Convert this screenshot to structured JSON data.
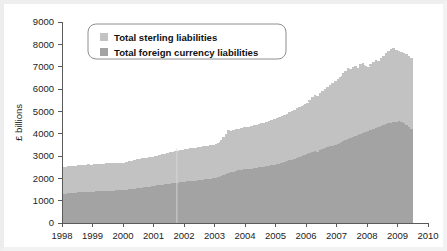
{
  "chart_data": {
    "type": "area",
    "title": "",
    "xlabel": "",
    "ylabel": "£ billions",
    "xlim": [
      1998.0,
      2010.0
    ],
    "ylim": [
      0,
      9000
    ],
    "grid": false,
    "stacked": true,
    "legend_position": "top-left",
    "x_tick_labels": [
      "1998",
      "1999",
      "2000",
      "2001",
      "2002",
      "2003",
      "2004",
      "2005",
      "2006",
      "2007",
      "2008",
      "2009",
      "2010"
    ],
    "x_ticks": [
      1998,
      1999,
      2000,
      2001,
      2002,
      2003,
      2004,
      2005,
      2006,
      2007,
      2008,
      2009,
      2010
    ],
    "y_tick_labels": [
      "0",
      "1000",
      "2000",
      "3000",
      "4000",
      "5000",
      "6000",
      "7000",
      "8000",
      "9000"
    ],
    "y_ticks": [
      0,
      1000,
      2000,
      3000,
      4000,
      5000,
      6000,
      7000,
      8000,
      9000
    ],
    "data_end_x": 2009.5,
    "colors": {
      "total_sterling_liabilities": "#c2c2c2",
      "total_foreign_currency_liabilities": "#a3a3a3",
      "axis": "#5a5a5a",
      "text": "#1c1c1c",
      "background": "#ffffff"
    },
    "series": [
      {
        "name": "Total foreign currency liabilities",
        "color": "#a3a3a3",
        "x": [
          1998.0,
          1998.08,
          1998.17,
          1998.25,
          1998.33,
          1998.42,
          1998.5,
          1998.58,
          1998.67,
          1998.75,
          1998.83,
          1998.92,
          1999.0,
          1999.08,
          1999.17,
          1999.25,
          1999.33,
          1999.42,
          1999.5,
          1999.58,
          1999.67,
          1999.75,
          1999.83,
          1999.92,
          2000.0,
          2000.08,
          2000.17,
          2000.25,
          2000.33,
          2000.42,
          2000.5,
          2000.58,
          2000.67,
          2000.75,
          2000.83,
          2000.92,
          2001.0,
          2001.08,
          2001.17,
          2001.25,
          2001.33,
          2001.42,
          2001.5,
          2001.58,
          2001.67,
          2001.75,
          2001.83,
          2001.92,
          2002.0,
          2002.08,
          2002.17,
          2002.25,
          2002.33,
          2002.42,
          2002.5,
          2002.58,
          2002.67,
          2002.75,
          2002.83,
          2002.92,
          2003.0,
          2003.08,
          2003.17,
          2003.25,
          2003.33,
          2003.42,
          2003.5,
          2003.58,
          2003.67,
          2003.75,
          2003.83,
          2003.92,
          2004.0,
          2004.08,
          2004.17,
          2004.25,
          2004.33,
          2004.42,
          2004.5,
          2004.58,
          2004.67,
          2004.75,
          2004.83,
          2004.92,
          2005.0,
          2005.08,
          2005.17,
          2005.25,
          2005.33,
          2005.42,
          2005.5,
          2005.58,
          2005.67,
          2005.75,
          2005.83,
          2005.92,
          2006.0,
          2006.08,
          2006.17,
          2006.25,
          2006.33,
          2006.42,
          2006.5,
          2006.58,
          2006.67,
          2006.75,
          2006.83,
          2006.92,
          2007.0,
          2007.08,
          2007.17,
          2007.25,
          2007.33,
          2007.42,
          2007.5,
          2007.58,
          2007.67,
          2007.75,
          2007.83,
          2007.92,
          2008.0,
          2008.08,
          2008.17,
          2008.25,
          2008.33,
          2008.42,
          2008.5,
          2008.58,
          2008.67,
          2008.75,
          2008.83,
          2008.92,
          2009.0,
          2009.08,
          2009.17,
          2009.25,
          2009.33,
          2009.42,
          2009.5
        ],
        "values": [
          1300,
          1320,
          1335,
          1340,
          1355,
          1360,
          1370,
          1380,
          1375,
          1390,
          1400,
          1395,
          1405,
          1415,
          1420,
          1430,
          1425,
          1440,
          1450,
          1445,
          1455,
          1460,
          1470,
          1465,
          1480,
          1500,
          1520,
          1530,
          1545,
          1560,
          1570,
          1580,
          1595,
          1610,
          1625,
          1640,
          1660,
          1680,
          1700,
          1710,
          1725,
          1740,
          1755,
          1770,
          1785,
          1800,
          1815,
          1830,
          1845,
          1860,
          1875,
          1885,
          1900,
          1915,
          1930,
          1945,
          1960,
          1975,
          1990,
          2005,
          2020,
          2060,
          2100,
          2150,
          2190,
          2230,
          2270,
          2300,
          2330,
          2360,
          2380,
          2400,
          2410,
          2420,
          2430,
          2450,
          2470,
          2490,
          2510,
          2530,
          2550,
          2570,
          2590,
          2610,
          2630,
          2660,
          2690,
          2720,
          2760,
          2800,
          2840,
          2880,
          2920,
          2960,
          3000,
          3040,
          3080,
          3130,
          3180,
          3230,
          3200,
          3250,
          3300,
          3350,
          3400,
          3430,
          3460,
          3500,
          3550,
          3600,
          3650,
          3700,
          3760,
          3800,
          3850,
          3900,
          3950,
          4000,
          4050,
          4080,
          4100,
          4150,
          4200,
          4250,
          4280,
          4330,
          4380,
          4430,
          4460,
          4490,
          4520,
          4540,
          4560,
          4530,
          4480,
          4400,
          4300,
          4200,
          4050
        ]
      },
      {
        "name": "Total sterling liabilities",
        "color": "#c2c2c2",
        "x": [
          1998.0,
          1998.08,
          1998.17,
          1998.25,
          1998.33,
          1998.42,
          1998.5,
          1998.58,
          1998.67,
          1998.75,
          1998.83,
          1998.92,
          1999.0,
          1999.08,
          1999.17,
          1999.25,
          1999.33,
          1999.42,
          1999.5,
          1999.58,
          1999.67,
          1999.75,
          1999.83,
          1999.92,
          2000.0,
          2000.08,
          2000.17,
          2000.25,
          2000.33,
          2000.42,
          2000.5,
          2000.58,
          2000.67,
          2000.75,
          2000.83,
          2000.92,
          2001.0,
          2001.08,
          2001.17,
          2001.25,
          2001.33,
          2001.42,
          2001.5,
          2001.58,
          2001.67,
          2001.75,
          2001.83,
          2001.92,
          2002.0,
          2002.08,
          2002.17,
          2002.25,
          2002.33,
          2002.42,
          2002.5,
          2002.58,
          2002.67,
          2002.75,
          2002.83,
          2002.92,
          2003.0,
          2003.08,
          2003.17,
          2003.25,
          2003.33,
          2003.42,
          2003.5,
          2003.58,
          2003.67,
          2003.75,
          2003.83,
          2003.92,
          2004.0,
          2004.08,
          2004.17,
          2004.25,
          2004.33,
          2004.42,
          2004.5,
          2004.58,
          2004.67,
          2004.75,
          2004.83,
          2004.92,
          2005.0,
          2005.08,
          2005.17,
          2005.25,
          2005.33,
          2005.42,
          2005.5,
          2005.58,
          2005.67,
          2005.75,
          2005.83,
          2005.92,
          2006.0,
          2006.08,
          2006.17,
          2006.25,
          2006.33,
          2006.42,
          2006.5,
          2006.58,
          2006.67,
          2006.75,
          2006.83,
          2006.92,
          2007.0,
          2007.08,
          2007.17,
          2007.25,
          2007.33,
          2007.42,
          2007.5,
          2007.58,
          2007.67,
          2007.75,
          2007.83,
          2007.92,
          2008.0,
          2008.08,
          2008.17,
          2008.25,
          2008.33,
          2008.42,
          2008.5,
          2008.58,
          2008.67,
          2008.75,
          2008.83,
          2008.92,
          2009.0,
          2009.08,
          2009.17,
          2009.25,
          2009.33,
          2009.42,
          2009.5
        ],
        "values_total": [
          2500,
          2520,
          2540,
          2550,
          2560,
          2570,
          2580,
          2600,
          2590,
          2610,
          2620,
          2615,
          2620,
          2630,
          2640,
          2655,
          2650,
          2665,
          2675,
          2670,
          2680,
          2690,
          2700,
          2695,
          2700,
          2720,
          2760,
          2790,
          2820,
          2850,
          2870,
          2890,
          2910,
          2930,
          2950,
          2970,
          2990,
          3020,
          3060,
          3080,
          3110,
          3140,
          3170,
          3190,
          3220,
          3240,
          3260,
          3290,
          3310,
          3330,
          3350,
          3360,
          3380,
          3400,
          3420,
          3440,
          3460,
          3470,
          3490,
          3510,
          3530,
          3600,
          3700,
          3850,
          4000,
          4150,
          4120,
          4180,
          4200,
          4230,
          4260,
          4280,
          4300,
          4320,
          4340,
          4370,
          4400,
          4430,
          4460,
          4490,
          4520,
          4560,
          4600,
          4640,
          4680,
          4730,
          4780,
          4830,
          4900,
          4960,
          5020,
          5080,
          5140,
          5200,
          5260,
          5320,
          5380,
          5500,
          5620,
          5750,
          5700,
          5800,
          5900,
          6000,
          6100,
          6180,
          6250,
          6350,
          6450,
          6550,
          6700,
          6800,
          6950,
          6900,
          7000,
          7050,
          6950,
          7100,
          7150,
          7050,
          7000,
          7100,
          7200,
          7300,
          7250,
          7400,
          7500,
          7600,
          7700,
          7800,
          7850,
          7750,
          7700,
          7650,
          7600,
          7550,
          7500,
          7400,
          7300
        ]
      }
    ],
    "legend": [
      {
        "label": "Total sterling liabilities",
        "color": "#c2c2c2"
      },
      {
        "label": "Total foreign currency liabilities",
        "color": "#a3a3a3"
      }
    ]
  }
}
